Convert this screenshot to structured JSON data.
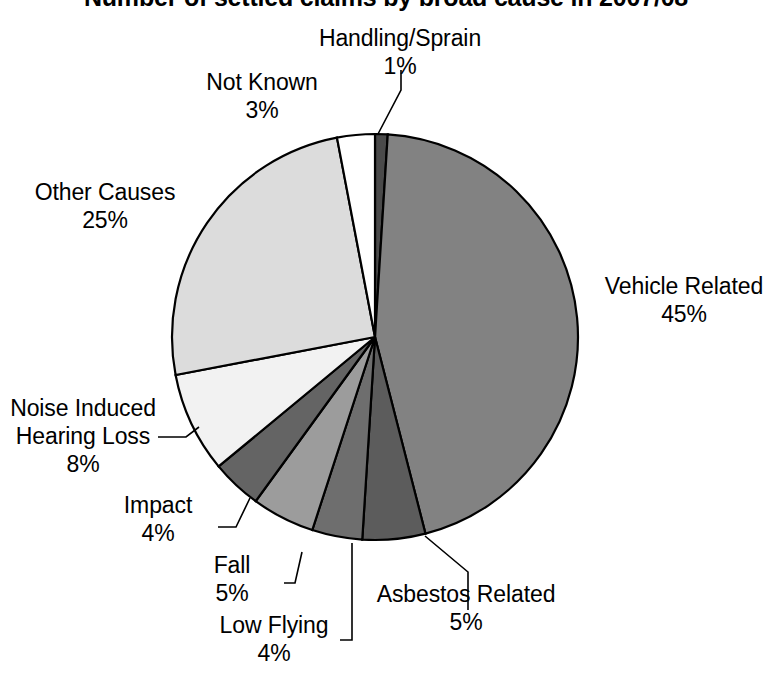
{
  "chart_data": {
    "type": "pie",
    "title": "Number of settled claims by broad cause in 2007/08",
    "subtitle": "",
    "xlabel": "",
    "ylabel": "",
    "legend_position": "none",
    "grid": false,
    "value_unit": "%",
    "start_angle_deg": 0,
    "direction": "clockwise",
    "categories": [
      "Handling/Sprain",
      "Vehicle Related",
      "Asbestos Related",
      "Low Flying",
      "Fall",
      "Impact",
      "Noise Induced Hearing Loss",
      "Other Causes",
      "Not Known"
    ],
    "values": [
      1,
      45,
      5,
      4,
      5,
      4,
      8,
      25,
      3
    ],
    "slices": [
      {
        "label": "Handling/Sprain",
        "value": 1,
        "value_text": "1%",
        "color": "#4a4a4a",
        "label_lines": [
          "Handling/Sprain",
          "1%"
        ],
        "label_align": "center"
      },
      {
        "label": "Vehicle Related",
        "value": 45,
        "value_text": "45%",
        "color": "#828282",
        "label_lines": [
          "Vehicle Related",
          "45%"
        ],
        "label_align": "center"
      },
      {
        "label": "Asbestos Related",
        "value": 5,
        "value_text": "5%",
        "color": "#5c5c5c",
        "label_lines": [
          "Asbestos Related",
          "5%"
        ],
        "label_align": "center"
      },
      {
        "label": "Low Flying",
        "value": 4,
        "value_text": "4%",
        "color": "#6e6e6e",
        "label_lines": [
          "Low Flying",
          "4%"
        ],
        "label_align": "center"
      },
      {
        "label": "Fall",
        "value": 5,
        "value_text": "5%",
        "color": "#9c9c9c",
        "label_lines": [
          "Fall",
          "5%"
        ],
        "label_align": "center"
      },
      {
        "label": "Impact",
        "value": 4,
        "value_text": "4%",
        "color": "#646464",
        "label_lines": [
          "Impact",
          "4%"
        ],
        "label_align": "center"
      },
      {
        "label": "Noise Induced Hearing Loss",
        "value": 8,
        "value_text": "8%",
        "color": "#f2f2f2",
        "label_lines": [
          "Noise Induced",
          "Hearing Loss",
          "8%"
        ],
        "label_align": "center"
      },
      {
        "label": "Other Causes",
        "value": 25,
        "value_text": "25%",
        "color": "#dcdcdc",
        "label_lines": [
          "Other Causes",
          "25%"
        ],
        "label_align": "center"
      },
      {
        "label": "Not Known",
        "value": 3,
        "value_text": "3%",
        "color": "#ffffff",
        "label_lines": [
          "Not Known",
          "3%"
        ],
        "label_align": "center"
      }
    ]
  },
  "labels": {
    "handling": {
      "name": "Handling/Sprain",
      "pct": "1%"
    },
    "not_known": {
      "name": "Not Known",
      "pct": "3%"
    },
    "other_causes": {
      "name": "Other Causes",
      "pct": "25%"
    },
    "noise_line1": "Noise Induced",
    "noise_line2": "Hearing Loss",
    "noise_pct": "8%",
    "impact": {
      "name": "Impact",
      "pct": "4%"
    },
    "fall": {
      "name": "Fall",
      "pct": "5%"
    },
    "low_flying": {
      "name": "Low Flying",
      "pct": "4%"
    },
    "asbestos": {
      "name": "Asbestos Related",
      "pct": "5%"
    },
    "vehicle": {
      "name": "Vehicle Related",
      "pct": "45%"
    }
  },
  "style": {
    "background": "#ffffff",
    "stroke": "#000000",
    "text_color": "#000000"
  },
  "geometry": {
    "center_x": 375,
    "center_y": 337,
    "radius": 203
  }
}
